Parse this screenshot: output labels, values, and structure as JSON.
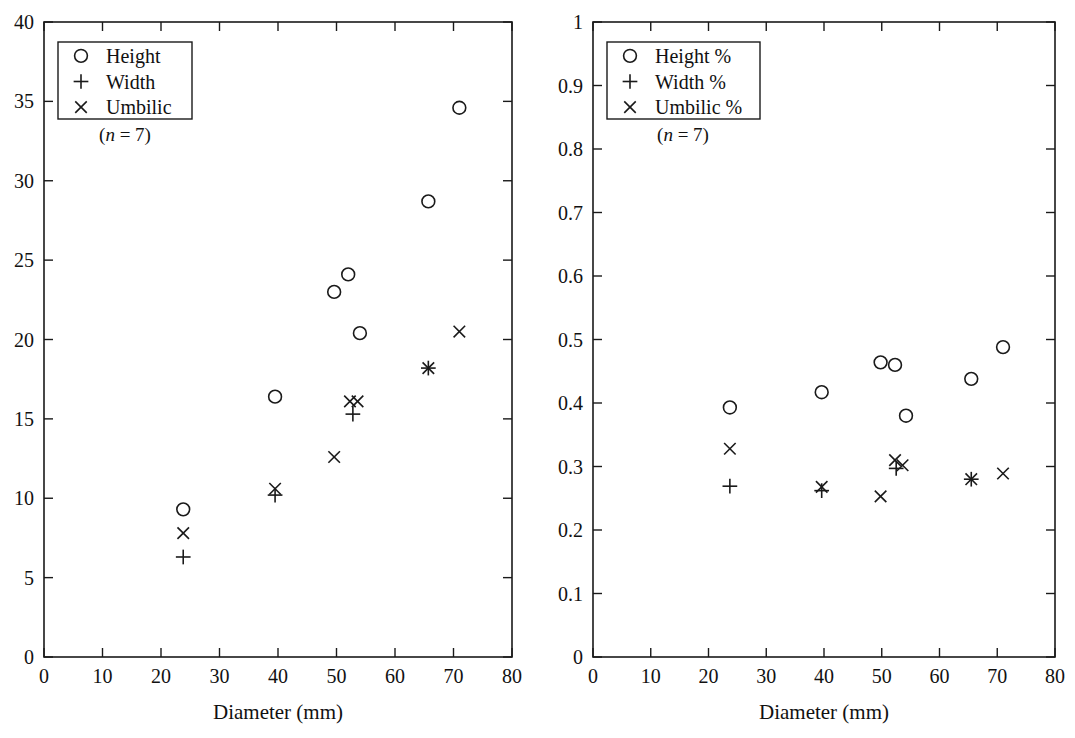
{
  "figure": {
    "background": "#ffffff",
    "ink_color": "#1a1a1a",
    "panel_count": 2
  },
  "chart_data": [
    {
      "type": "scatter",
      "panel": "left",
      "title": "",
      "xlabel": "Diameter (mm)",
      "ylabel": "",
      "xlim": [
        0,
        80
      ],
      "ylim": [
        0,
        40
      ],
      "xticks": [
        0,
        10,
        20,
        30,
        40,
        50,
        60,
        70,
        80
      ],
      "yticks": [
        0,
        5,
        10,
        15,
        20,
        25,
        30,
        35,
        40
      ],
      "xticklabels": [
        "0",
        "10",
        "20",
        "30",
        "40",
        "50",
        "60",
        "70",
        "80"
      ],
      "yticklabels": [
        "0",
        "5",
        "10",
        "15",
        "20",
        "25",
        "30",
        "35",
        "40"
      ],
      "grid": false,
      "legend_position": "upper left",
      "annotation": "(n = 7)",
      "sample_size": 7,
      "series": [
        {
          "name": "Height",
          "marker": "circle",
          "x": [
            23.8,
            39.5,
            49.6,
            52.0,
            54.0,
            65.7,
            71.0
          ],
          "y": [
            9.3,
            16.4,
            23.0,
            24.1,
            20.4,
            28.7,
            34.6
          ]
        },
        {
          "name": "Width",
          "marker": "plus",
          "x": [
            23.8,
            39.5,
            52.8,
            65.7
          ],
          "y": [
            6.3,
            10.2,
            15.3,
            18.2
          ]
        },
        {
          "name": "Umbilic",
          "marker": "cross",
          "x": [
            23.8,
            39.5,
            49.6,
            52.3,
            53.6,
            65.7,
            71.0
          ],
          "y": [
            7.8,
            10.6,
            12.6,
            16.1,
            16.1,
            18.2,
            20.5
          ]
        }
      ]
    },
    {
      "type": "scatter",
      "panel": "right",
      "title": "",
      "xlabel": "Diameter (mm)",
      "ylabel": "",
      "xlim": [
        0,
        80
      ],
      "ylim": [
        0,
        1
      ],
      "xticks": [
        0,
        10,
        20,
        30,
        40,
        50,
        60,
        70,
        80
      ],
      "yticks": [
        0,
        0.1,
        0.2,
        0.3,
        0.4,
        0.5,
        0.6,
        0.7,
        0.8,
        0.9,
        1
      ],
      "xticklabels": [
        "0",
        "10",
        "20",
        "30",
        "40",
        "50",
        "60",
        "70",
        "80"
      ],
      "yticklabels": [
        "0",
        "0.1",
        "0.2",
        "0.3",
        "0.4",
        "0.5",
        "0.6",
        "0.7",
        "0.8",
        "0.9",
        "1"
      ],
      "grid": false,
      "legend_position": "upper left",
      "annotation": "(n = 7)",
      "sample_size": 7,
      "series": [
        {
          "name": "Height %",
          "marker": "circle",
          "x": [
            23.7,
            39.6,
            49.8,
            52.3,
            54.2,
            65.5,
            71.0
          ],
          "y": [
            0.393,
            0.417,
            0.464,
            0.46,
            0.38,
            0.438,
            0.488
          ]
        },
        {
          "name": "Width %",
          "marker": "plus",
          "x": [
            23.7,
            39.6,
            52.5,
            65.5
          ],
          "y": [
            0.269,
            0.262,
            0.297,
            0.28
          ]
        },
        {
          "name": "Umbilic %",
          "marker": "cross",
          "x": [
            23.7,
            39.6,
            49.8,
            52.3,
            53.6,
            65.5,
            71.0
          ],
          "y": [
            0.328,
            0.268,
            0.253,
            0.31,
            0.302,
            0.28,
            0.289
          ]
        }
      ]
    }
  ],
  "panels": {
    "left": {
      "legend": {
        "entries": [
          {
            "marker": "circle",
            "label": "Height"
          },
          {
            "marker": "plus",
            "label": "Width"
          },
          {
            "marker": "cross",
            "label": "Umbilic"
          }
        ],
        "note": "(n = 7)",
        "note_prefix": "(",
        "note_italic": "n",
        "note_suffix": " = 7)"
      },
      "xlabel": "Diameter (mm)"
    },
    "right": {
      "legend": {
        "entries": [
          {
            "marker": "circle",
            "label": "Height %"
          },
          {
            "marker": "plus",
            "label": "Width %"
          },
          {
            "marker": "cross",
            "label": "Umbilic %"
          }
        ],
        "note": "(n = 7)",
        "note_prefix": "(",
        "note_italic": "n",
        "note_suffix": " = 7)"
      },
      "xlabel": "Diameter (mm)"
    }
  }
}
